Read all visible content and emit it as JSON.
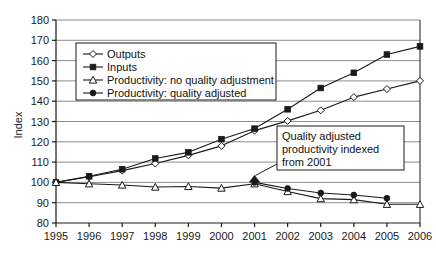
{
  "chart_data": {
    "type": "line",
    "title": "",
    "xlabel": "",
    "ylabel": "Index",
    "categories": [
      "1995",
      "1996",
      "1997",
      "1998",
      "1999",
      "2000",
      "2001",
      "2002",
      "2003",
      "2004",
      "2005",
      "2006"
    ],
    "x": [
      1995,
      1996,
      1997,
      1998,
      1999,
      2000,
      2001,
      2002,
      2003,
      2004,
      2005,
      2006
    ],
    "ylim": [
      80,
      180
    ],
    "ytick_step": 10,
    "yticks": [
      80,
      90,
      100,
      110,
      120,
      130,
      140,
      150,
      160,
      170,
      180
    ],
    "grid": "horizontal",
    "legend_position": "upper-left-inside",
    "series": [
      {
        "name": "Outputs",
        "marker": "open-diamond",
        "values": [
          100,
          102.8,
          105.8,
          109.3,
          113.3,
          118.0,
          125.5,
          130.3,
          135.5,
          142.0,
          146.0,
          150.0
        ]
      },
      {
        "name": "Inputs",
        "marker": "filled-square",
        "values": [
          100,
          103.0,
          106.5,
          111.8,
          114.8,
          121.3,
          126.5,
          136.0,
          146.5,
          154.0,
          163.0,
          167.0
        ]
      },
      {
        "name": "Productivity: no quality adjustment",
        "marker": "open-triangle",
        "values": [
          100,
          99.3,
          98.7,
          97.7,
          98.0,
          97.2,
          99.3,
          95.5,
          92.0,
          91.5,
          89.2,
          89.2
        ]
      },
      {
        "name": "Productivity: quality adjusted",
        "marker": "filled-circle",
        "values": [
          null,
          null,
          null,
          null,
          null,
          null,
          100.0,
          97.0,
          94.8,
          93.8,
          92.2,
          null
        ]
      }
    ],
    "annotations": [
      {
        "name": "quality-adjusted-note",
        "lines": [
          "Quality adjusted",
          "productivity indexed",
          "from 2001"
        ],
        "points_to_year": 2001
      }
    ]
  },
  "legend": {
    "entries": [
      {
        "label": "Outputs",
        "marker": "open-diamond"
      },
      {
        "label": "Inputs",
        "marker": "filled-square"
      },
      {
        "label": "Productivity: no quality adjustment",
        "marker": "open-triangle"
      },
      {
        "label": "Productivity: quality adjusted",
        "marker": "filled-circle"
      }
    ]
  },
  "colors": {
    "line": "#1a1a1a",
    "grid": "#808080",
    "axis": "#1a1a1a",
    "background": "#ffffff",
    "marker_fill_open": "#ffffff",
    "marker_fill_solid": "#1a1a1a"
  }
}
